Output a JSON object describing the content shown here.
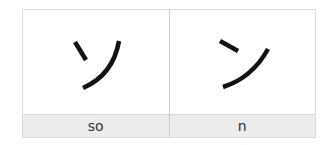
{
  "cards": [
    {
      "character": "ソ",
      "romaji": "so"
    },
    {
      "character": "ン",
      "romaji": "n"
    }
  ],
  "colors": {
    "border": "#dcdcdc",
    "label_bg": "#ececec",
    "stroke": "#111111"
  }
}
